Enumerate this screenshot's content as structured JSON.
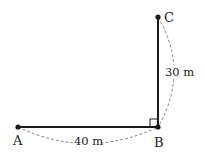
{
  "diagram": {
    "type": "right-triangle-walk",
    "points": {
      "A": {
        "label": "A",
        "x": 18,
        "y": 127
      },
      "B": {
        "label": "B",
        "x": 158,
        "y": 127
      },
      "C": {
        "label": "C",
        "x": 158,
        "y": 17
      }
    },
    "segments": [
      {
        "from": "A",
        "to": "B",
        "style": "solid",
        "length_label": "40 m"
      },
      {
        "from": "B",
        "to": "C",
        "style": "solid",
        "length_label": "30 m"
      }
    ],
    "right_angle_at": "B",
    "colors": {
      "line": "#1a1a1a",
      "dashed": "#888888",
      "text": "#222222"
    }
  }
}
